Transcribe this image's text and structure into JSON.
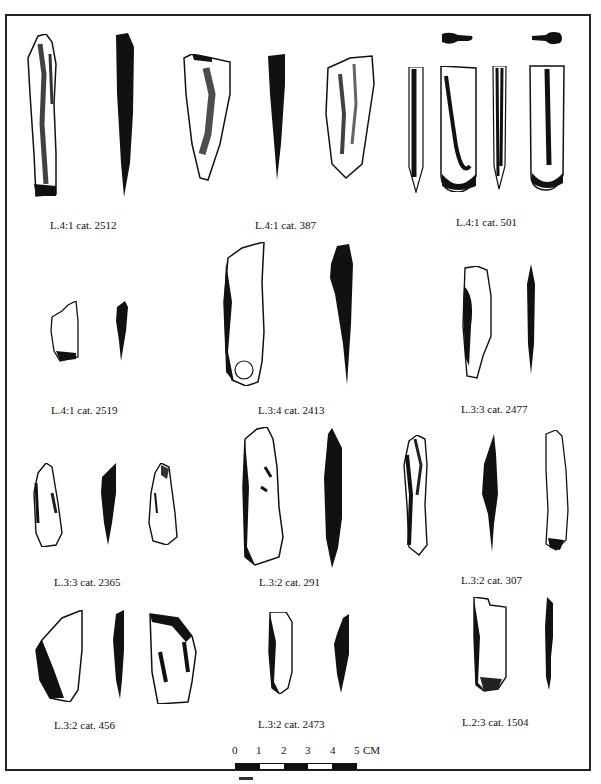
{
  "plate": {
    "frame": {
      "border_color": "#222222",
      "background": "#ffffff"
    },
    "rows": [
      {
        "items": [
          {
            "label": "L.4:1 cat. 2512",
            "views": [
              "stippled-drawing",
              "solid-profile"
            ]
          },
          {
            "label": "L.4:1 cat. 387",
            "views": [
              "stippled-drawing",
              "solid-profile",
              "stippled-drawing"
            ]
          },
          {
            "label": "L.4:1 cat. 501",
            "views": [
              "solid-cross-section",
              "solid-cross-section",
              "stippled-profile",
              "stippled-drawing",
              "stippled-profile",
              "stippled-drawing"
            ]
          }
        ]
      },
      {
        "items": [
          {
            "label": "L.4:1 cat. 2519",
            "views": [
              "stippled-drawing",
              "solid-profile"
            ]
          },
          {
            "label": "L.3:4 cat. 2413",
            "views": [
              "stippled-drawing",
              "solid-profile"
            ]
          },
          {
            "label": "L.3:3 cat. 2477",
            "views": [
              "stippled-drawing",
              "solid-profile"
            ]
          }
        ]
      },
      {
        "items": [
          {
            "label": "L.3:3 cat. 2365",
            "views": [
              "stippled-drawing",
              "solid-profile",
              "stippled-drawing"
            ]
          },
          {
            "label": "L.3:2 cat. 291",
            "views": [
              "stippled-drawing",
              "solid-profile"
            ]
          },
          {
            "label": "L.3:2 cat. 307",
            "views": [
              "stippled-drawing",
              "solid-profile",
              "stippled-drawing"
            ]
          }
        ]
      },
      {
        "items": [
          {
            "label": "L.3:2 cat. 456",
            "views": [
              "stippled-drawing",
              "solid-profile",
              "stippled-drawing"
            ]
          },
          {
            "label": "L.3:2 cat. 2473",
            "views": [
              "stippled-drawing",
              "solid-profile"
            ]
          },
          {
            "label": "L.2:3 cat. 1504",
            "views": [
              "stippled-drawing",
              "solid-profile"
            ]
          }
        ]
      }
    ],
    "scale": {
      "ticks": [
        "0",
        "1",
        "2",
        "3",
        "4",
        "5"
      ],
      "unit": "CM",
      "segment_colors": [
        "#111111",
        "#ffffff",
        "#111111",
        "#ffffff",
        "#111111"
      ]
    }
  }
}
